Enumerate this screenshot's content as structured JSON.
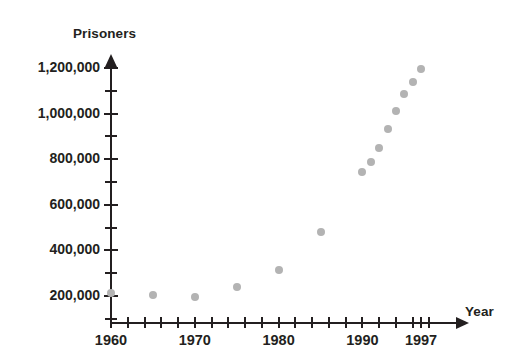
{
  "chart_data": {
    "type": "scatter",
    "title": "",
    "xlabel": "Year",
    "ylabel": "Prisoners",
    "xlim": [
      1960,
      1999
    ],
    "ylim": [
      0,
      1300000
    ],
    "grid": false,
    "legend": "none",
    "x_tick_labels": [
      "1960",
      "1970",
      "1980",
      "1990",
      "1997"
    ],
    "x_tick_label_values": [
      1960,
      1970,
      1980,
      1990,
      1997
    ],
    "x_minor_tick_step": 2,
    "y_tick_labels": [
      "200,000",
      "400,000",
      "600,000",
      "800,000",
      "1,000,000",
      "1,200,000"
    ],
    "y_tick_label_values": [
      200000,
      400000,
      600000,
      800000,
      1000000,
      1200000
    ],
    "y_minor_tick_step": 100000,
    "marker_color": "#b3b3b3",
    "axis_color": "#231f20",
    "x": [
      1960,
      1965,
      1970,
      1975,
      1980,
      1985,
      1990,
      1991,
      1992,
      1993,
      1994,
      1995,
      1996,
      1997
    ],
    "values": [
      215000,
      205000,
      196000,
      241000,
      316000,
      481000,
      744000,
      789000,
      847000,
      932000,
      1012000,
      1085000,
      1139000,
      1197000
    ],
    "points": [
      {
        "year": 1960,
        "prisoners": 215000
      },
      {
        "year": 1965,
        "prisoners": 205000
      },
      {
        "year": 1970,
        "prisoners": 196000
      },
      {
        "year": 1975,
        "prisoners": 241000
      },
      {
        "year": 1980,
        "prisoners": 316000
      },
      {
        "year": 1985,
        "prisoners": 481000
      },
      {
        "year": 1990,
        "prisoners": 744000
      },
      {
        "year": 1991,
        "prisoners": 789000
      },
      {
        "year": 1992,
        "prisoners": 847000
      },
      {
        "year": 1993,
        "prisoners": 932000
      },
      {
        "year": 1994,
        "prisoners": 1012000
      },
      {
        "year": 1995,
        "prisoners": 1085000
      },
      {
        "year": 1996,
        "prisoners": 1139000
      },
      {
        "year": 1997,
        "prisoners": 1197000
      }
    ]
  },
  "axes": {
    "y_title": "Prisoners",
    "x_title": "Year"
  }
}
